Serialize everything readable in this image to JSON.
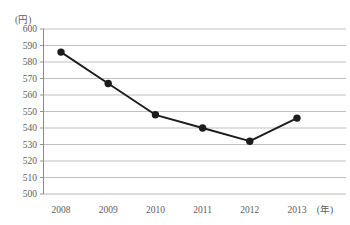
{
  "chart_data": {
    "type": "line",
    "title": "",
    "subtitle": "",
    "xlabel": "(年)",
    "ylabel": "(円)",
    "categories": [
      "2008",
      "2009",
      "2010",
      "2011",
      "2012",
      "2013"
    ],
    "x": [
      2008,
      2009,
      2010,
      2011,
      2012,
      2013
    ],
    "values": [
      586,
      567,
      548,
      540,
      532,
      546
    ],
    "series": [
      {
        "name": "",
        "values": [
          586,
          567,
          548,
          540,
          532,
          546
        ]
      }
    ],
    "ylim": [
      500,
      600
    ],
    "ytick_step": 10,
    "yticks": [
      600,
      590,
      580,
      570,
      560,
      550,
      540,
      530,
      520,
      510,
      500
    ],
    "ytick_labels": [
      "600",
      "590",
      "580",
      "570",
      "560",
      "550",
      "540",
      "530",
      "520",
      "510",
      "500"
    ],
    "xtick_labels": [
      "2008",
      "2009",
      "2010",
      "2011",
      "2012",
      "2013"
    ],
    "grid": true,
    "grid_axis": "y",
    "legend": false,
    "legend_position": "none",
    "marker": "circle",
    "line_color": "#1c1c1c",
    "marker_color": "#1c1c1c",
    "grid_color": "#b9b9b9",
    "axis_color": "#8a8a8a",
    "text_color": "#5d5d5d",
    "background_color": "#ffffff",
    "annotations": []
  },
  "axes": {
    "y_unit": "(円)",
    "x_unit": "(年)"
  }
}
